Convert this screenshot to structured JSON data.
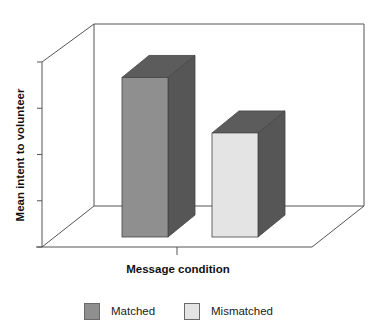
{
  "chart_data": {
    "type": "bar",
    "style": "3d-column",
    "title": "",
    "xlabel": "Message condition",
    "ylabel": "Mean intent to volunteer",
    "categories": [
      "Matched",
      "Mismatched"
    ],
    "values": [
      3.45,
      2.25
    ],
    "value_units": "y-axis tick intervals (axis has no numeric labels)",
    "ylim": [
      0,
      4
    ],
    "yticks": [
      0,
      1,
      2,
      3,
      4
    ],
    "ytick_labels": [],
    "grid": false,
    "legend": {
      "placement": "bottom",
      "entries": [
        {
          "label": "Matched",
          "color": "#8f8f8f"
        },
        {
          "label": "Mismatched",
          "color": "#e4e4e4"
        }
      ]
    },
    "colors": {
      "matched_front": "#8f8f8f",
      "matched_side": "#565656",
      "matched_top": "#5c5c5c",
      "mismatched_front": "#e4e4e4",
      "mismatched_side": "#565656",
      "mismatched_top": "#5c5c5c",
      "axis": "#555555"
    }
  }
}
